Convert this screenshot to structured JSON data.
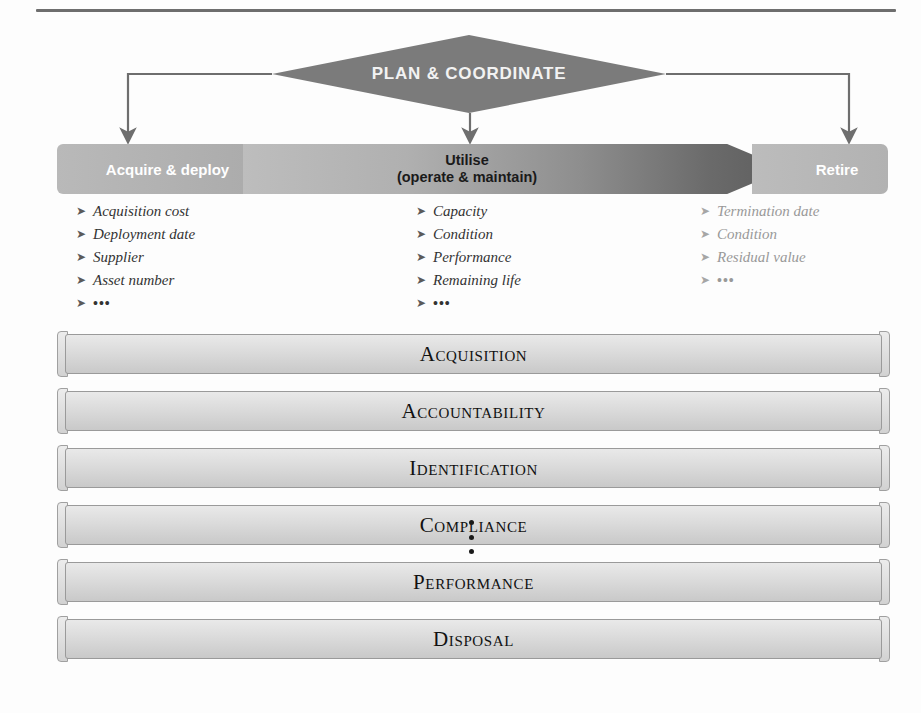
{
  "diagram": {
    "title_shape": {
      "label": "PLAN & COORDINATE",
      "shape": "diamond",
      "fill": "#7b7b7b",
      "text_color": "#f2f2f2"
    },
    "lifecycle_band": {
      "segments": [
        {
          "label": "Acquire & deploy",
          "text_color": "#ffffff",
          "fill": "#b2b2b2"
        },
        {
          "label_line1": "Utilise",
          "label_line2": "(operate & maintain)",
          "text_color": "#1a1a1a",
          "fill": "#8e8e8e"
        },
        {
          "label": "Retire",
          "text_color": "#ffffff",
          "fill": "#b6b6b6"
        }
      ]
    },
    "attribute_columns": [
      {
        "name": "acquire-deploy-attributes",
        "marker": "➤",
        "text_color": "#333333",
        "items": [
          "Acquisition cost",
          "Deployment date",
          "Supplier",
          "Asset number",
          "•••"
        ]
      },
      {
        "name": "utilise-attributes",
        "marker": "➤",
        "text_color": "#333333",
        "items": [
          "Capacity",
          "Condition",
          "Performance",
          "Remaining life",
          "•••"
        ]
      },
      {
        "name": "retire-attributes",
        "marker": "➤",
        "text_color": "#999999",
        "items": [
          "Termination date",
          "Condition",
          "Residual value",
          "•••"
        ]
      }
    ],
    "element_bars": [
      {
        "label": "Acquisition"
      },
      {
        "label": "Accountability"
      },
      {
        "label": "Identification"
      },
      {
        "label": "Compliance"
      },
      {
        "label": "Performance"
      },
      {
        "label": "Disposal"
      }
    ],
    "continuation_marker": "⋮",
    "connector_color": "#6e6e6e"
  }
}
